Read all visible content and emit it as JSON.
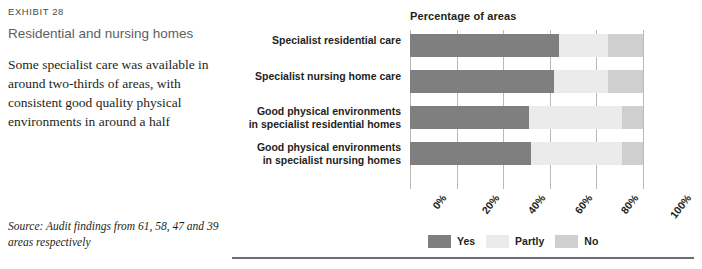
{
  "exhibit": {
    "label": "EXHIBIT 28",
    "title": "Residential and nursing homes",
    "description": "Some specialist care was available in around two-thirds of areas, with consistent good quality physical environments in around a half",
    "source": "Source: Audit findings from 61, 58, 47 and 39 areas respectively"
  },
  "legend": {
    "items": [
      {
        "label": "Yes",
        "color": "#7f7f7f"
      },
      {
        "label": "Partly",
        "color": "#ebebeb"
      },
      {
        "label": "No",
        "color": "#cfcfcf"
      }
    ]
  },
  "chart_data": {
    "type": "bar",
    "orientation": "horizontal",
    "stacked": true,
    "percent": true,
    "title": "Percentage of areas",
    "xlabel": "",
    "ylabel": "",
    "xlim": [
      0,
      100
    ],
    "grid": true,
    "legend_position": "bottom",
    "categories": [
      "Specialist residential care",
      "Specialist nursing home care",
      "Good physical environments in specialist residential homes",
      "Good physical environments in specialist nursing homes"
    ],
    "tick_labels": [
      "0%",
      "20%",
      "40%",
      "60%",
      "80%",
      "100%"
    ],
    "tick_values": [
      0,
      20,
      40,
      60,
      80,
      100
    ],
    "series": [
      {
        "name": "Yes",
        "color": "#7f7f7f",
        "values": [
          64,
          62,
          51,
          52
        ]
      },
      {
        "name": "Partly",
        "color": "#ebebeb",
        "values": [
          21,
          23,
          40,
          39
        ]
      },
      {
        "name": "No",
        "color": "#cfcfcf",
        "values": [
          15,
          15,
          9,
          9
        ]
      }
    ]
  }
}
